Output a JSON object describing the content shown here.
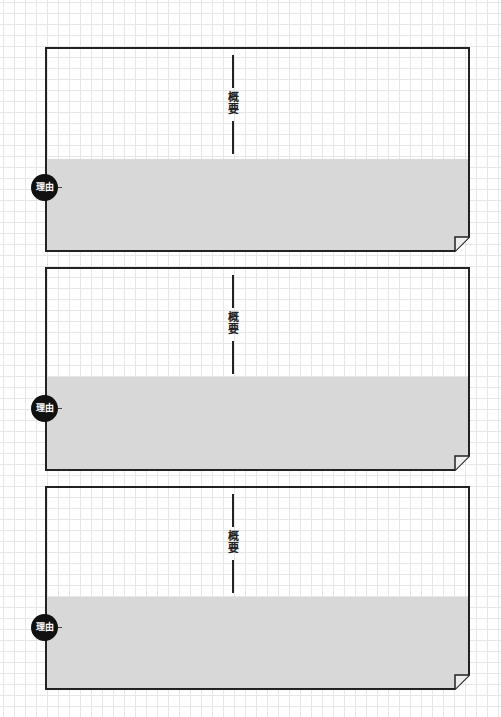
{
  "sheet": {
    "background": "#ffffff",
    "grid_color": "#e6e6e6",
    "card_count": 3,
    "colors": {
      "border": "#222222",
      "reason_fill": "#d8d8d8",
      "badge_fill": "#111111",
      "badge_text": "#ffffff"
    }
  },
  "cards": [
    {
      "summary_label": "概要",
      "reason_badge": "理由"
    },
    {
      "summary_label": "概要",
      "reason_badge": "理由"
    },
    {
      "summary_label": "概要",
      "reason_badge": "理由"
    }
  ]
}
